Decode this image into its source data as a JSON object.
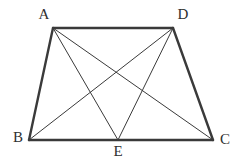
{
  "figure": {
    "kind": "geometry-diagram",
    "shape_name": "trapezoid-with-cevians",
    "background_color": "#ffffff",
    "stroke_color": "#3a3a3a",
    "label_color": "#2f2f2f",
    "outline_width": 2.4,
    "inner_width": 1.0,
    "canvas": {
      "width": 239,
      "height": 160
    },
    "points": {
      "A": {
        "name": "A",
        "x": 53,
        "y": 28
      },
      "D": {
        "name": "D",
        "x": 173,
        "y": 28
      },
      "B": {
        "name": "B",
        "x": 29,
        "y": 140
      },
      "E": {
        "name": "E",
        "x": 118,
        "y": 140
      },
      "C": {
        "name": "C",
        "x": 213,
        "y": 140
      }
    },
    "outline_segments": [
      {
        "id": "seg-AD",
        "from": "A",
        "to": "D",
        "x1": 53,
        "y1": 28,
        "x2": 173,
        "y2": 28
      },
      {
        "id": "seg-AB",
        "from": "A",
        "to": "B",
        "x1": 53,
        "y1": 28,
        "x2": 29,
        "y2": 140
      },
      {
        "id": "seg-BC",
        "from": "B",
        "to": "C",
        "x1": 29,
        "y1": 140,
        "x2": 213,
        "y2": 140
      },
      {
        "id": "seg-DC",
        "from": "D",
        "to": "C",
        "x1": 173,
        "y1": 28,
        "x2": 213,
        "y2": 140
      }
    ],
    "inner_segments": [
      {
        "id": "seg-AE",
        "from": "A",
        "to": "E",
        "x1": 53,
        "y1": 28,
        "x2": 118,
        "y2": 140
      },
      {
        "id": "seg-AC",
        "from": "A",
        "to": "C",
        "x1": 53,
        "y1": 28,
        "x2": 213,
        "y2": 140
      },
      {
        "id": "seg-DB",
        "from": "D",
        "to": "B",
        "x1": 173,
        "y1": 28,
        "x2": 29,
        "y2": 140
      },
      {
        "id": "seg-DE",
        "from": "D",
        "to": "E",
        "x1": 173,
        "y1": 28,
        "x2": 118,
        "y2": 140
      }
    ],
    "labels": [
      {
        "id": "label-A",
        "text": "A",
        "x": 44,
        "y": 16
      },
      {
        "id": "label-D",
        "text": "D",
        "x": 183,
        "y": 16
      },
      {
        "id": "label-B",
        "text": "B",
        "x": 18,
        "y": 139
      },
      {
        "id": "label-E",
        "text": "E",
        "x": 118,
        "y": 153
      },
      {
        "id": "label-C",
        "text": "C",
        "x": 225,
        "y": 141
      }
    ]
  }
}
